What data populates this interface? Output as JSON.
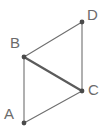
{
  "figure": {
    "type": "geometry-diagram",
    "canvas": {
      "width": 108,
      "height": 135
    },
    "background_color": "#ffffff",
    "style": {
      "line_color": "#6f6f6f",
      "diagonal_color": "#5b5b5b",
      "point_color": "#4a4a4a",
      "label_color": "#6b6b6b",
      "thin_stroke_width": 1.1,
      "thick_stroke_width": 2.2,
      "point_radius": 2.4,
      "label_font_size": 15
    },
    "points": [
      {
        "id": "A",
        "label": "A",
        "x": 24,
        "y": 123,
        "label_x": 4,
        "label_y": 106
      },
      {
        "id": "B",
        "label": "B",
        "x": 24,
        "y": 57,
        "label_x": 10,
        "label_y": 35
      },
      {
        "id": "C",
        "label": "C",
        "x": 82,
        "y": 91,
        "label_x": 88,
        "label_y": 82
      },
      {
        "id": "D",
        "label": "D",
        "x": 82,
        "y": 22,
        "label_x": 87,
        "label_y": 7
      }
    ],
    "edges": [
      {
        "id": "AB",
        "from": "A",
        "to": "B",
        "weight": "thin",
        "x1": 24,
        "y1": 123,
        "x2": 24,
        "y2": 57
      },
      {
        "id": "BD",
        "from": "B",
        "to": "D",
        "weight": "thin",
        "x1": 24,
        "y1": 57,
        "x2": 82,
        "y2": 22
      },
      {
        "id": "DC",
        "from": "D",
        "to": "C",
        "weight": "thin",
        "x1": 82,
        "y1": 22,
        "x2": 82,
        "y2": 91
      },
      {
        "id": "AC",
        "from": "A",
        "to": "C",
        "weight": "thin",
        "x1": 24,
        "y1": 123,
        "x2": 82,
        "y2": 91
      },
      {
        "id": "BC",
        "from": "B",
        "to": "C",
        "weight": "thick",
        "x1": 24,
        "y1": 57,
        "x2": 82,
        "y2": 91
      }
    ]
  }
}
